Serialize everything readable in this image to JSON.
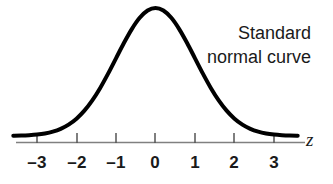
{
  "figure": {
    "width": 333,
    "height": 184,
    "background_color": "#ffffff"
  },
  "annotation": {
    "line1": "Standard",
    "line2": "normal curve"
  },
  "axis": {
    "variable_label": "z",
    "line_color": "#808080",
    "tick_color": "#555555"
  },
  "curve": {
    "color": "#000000",
    "stroke_width": 4
  },
  "ticks": [
    {
      "label": "–3",
      "value": -3,
      "x": 37
    },
    {
      "label": "–2",
      "value": -2,
      "x": 77
    },
    {
      "label": "–1",
      "value": -1,
      "x": 116
    },
    {
      "label": "0",
      "value": 0,
      "x": 155
    },
    {
      "label": "1",
      "value": 1,
      "x": 195
    },
    {
      "label": "2",
      "value": 2,
      "x": 234
    },
    {
      "label": "3",
      "value": 3,
      "x": 274
    }
  ],
  "chart_data": {
    "type": "line",
    "title": "Standard normal curve",
    "xlabel": "z",
    "ylabel": "",
    "xlim": [
      -3.6,
      3.6
    ],
    "ylim": [
      0,
      0.4
    ],
    "grid": false,
    "legend": "none",
    "annotations": [
      "Standard",
      "normal curve"
    ],
    "xticks": [
      -3,
      -2,
      -1,
      0,
      1,
      2,
      3
    ],
    "xticklabels": [
      "–3",
      "–2",
      "–1",
      "0",
      "1",
      "2",
      "3"
    ],
    "series": [
      {
        "name": "standard normal density",
        "mean": 0,
        "sd": 1,
        "x": [
          -3.6,
          -3.4,
          -3.2,
          -3.0,
          -2.8,
          -2.6,
          -2.4,
          -2.2,
          -2.0,
          -1.8,
          -1.6,
          -1.4,
          -1.2,
          -1.0,
          -0.8,
          -0.6,
          -0.4,
          -0.2,
          0.0,
          0.2,
          0.4,
          0.6,
          0.8,
          1.0,
          1.2,
          1.4,
          1.6,
          1.8,
          2.0,
          2.2,
          2.4,
          2.6,
          2.8,
          3.0,
          3.2,
          3.4,
          3.6
        ],
        "values": [
          0.0006,
          0.0012,
          0.0024,
          0.0044,
          0.0079,
          0.0136,
          0.0224,
          0.0355,
          0.054,
          0.079,
          0.1109,
          0.1497,
          0.1942,
          0.242,
          0.2897,
          0.3332,
          0.3683,
          0.391,
          0.3989,
          0.391,
          0.3683,
          0.3332,
          0.2897,
          0.242,
          0.1942,
          0.1497,
          0.1109,
          0.079,
          0.054,
          0.0355,
          0.0224,
          0.0136,
          0.0079,
          0.0044,
          0.0024,
          0.0012,
          0.0006
        ]
      }
    ]
  }
}
